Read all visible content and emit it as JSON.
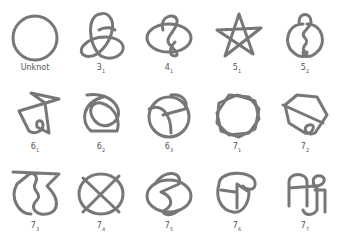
{
  "stroke_color": "#777777",
  "knots": [
    {
      "name": "Unknot",
      "n": "",
      "sub": ""
    },
    {
      "name": "3_1",
      "n": "3",
      "sub": "1"
    },
    {
      "name": "4_1",
      "n": "4",
      "sub": "1"
    },
    {
      "name": "5_1",
      "n": "5",
      "sub": "1"
    },
    {
      "name": "5_2",
      "n": "5",
      "sub": "2"
    },
    {
      "name": "6_1",
      "n": "6",
      "sub": "1"
    },
    {
      "name": "6_2",
      "n": "6",
      "sub": "2"
    },
    {
      "name": "6_3",
      "n": "6",
      "sub": "3"
    },
    {
      "name": "7_1",
      "n": "7",
      "sub": "1"
    },
    {
      "name": "7_2",
      "n": "7",
      "sub": "2"
    },
    {
      "name": "7_3",
      "n": "7",
      "sub": "3"
    },
    {
      "name": "7_4",
      "n": "7",
      "sub": "4"
    },
    {
      "name": "7_5",
      "n": "7",
      "sub": "5"
    },
    {
      "name": "7_6",
      "n": "7",
      "sub": "6"
    },
    {
      "name": "7_7",
      "n": "7",
      "sub": "7"
    }
  ],
  "unknot_label": "Unknot"
}
